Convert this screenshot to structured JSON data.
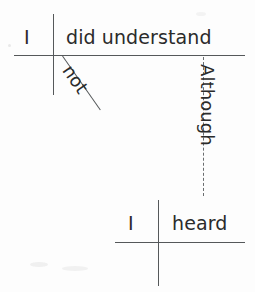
{
  "diagram": {
    "type": "reed-kellogg-sentence-diagram",
    "sentence": "I did not understand Although I heard",
    "main_clause": {
      "subject": "I",
      "predicate": "did understand",
      "modifier": "not"
    },
    "subordinate_clause": {
      "conjunction": "Although",
      "subject": "I",
      "predicate": "heard"
    }
  },
  "colors": {
    "ink": "#2b2b2b",
    "rule": "#55585a",
    "dashed_rule": "#6a6d6f",
    "paper": "#fdfdfd"
  }
}
